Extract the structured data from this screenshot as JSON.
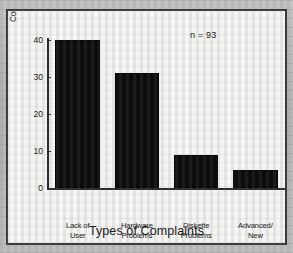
{
  "chart_data": {
    "type": "bar",
    "title": "",
    "xlabel": "Types of Complaints",
    "ylabel": "Number of\nComplaints",
    "ylabel_line1": "Number of",
    "ylabel_line2": "Complaints",
    "categories": [
      "Lack of\nUser\nKnowledge",
      "Hardware\nProblems",
      "Diskette\nProblems",
      "Advanced/\nNew\nSoftware\nUsage"
    ],
    "category_lines": [
      [
        "Lack of",
        "User",
        "Knowledge"
      ],
      [
        "Hardware",
        "Problems"
      ],
      [
        "Diskette",
        "Problems"
      ],
      [
        "Advanced/",
        "New",
        "Software",
        "Usage"
      ]
    ],
    "values": [
      40,
      31,
      9,
      5
    ],
    "ylim": [
      0,
      40
    ],
    "yticks": [
      0,
      10,
      20,
      30,
      40
    ],
    "ytick_labels": [
      "0",
      "10",
      "20",
      "30",
      "40"
    ],
    "grid": false,
    "legend": false,
    "annotations": [
      {
        "text": "n = 93",
        "position": "top-right"
      }
    ],
    "bar_color": "#0d0d0d",
    "axis_color": "#2b2b2b",
    "panel_color": "#f4f4f2",
    "page_color": "#bcbcba"
  },
  "annotation_n": "n = 93"
}
